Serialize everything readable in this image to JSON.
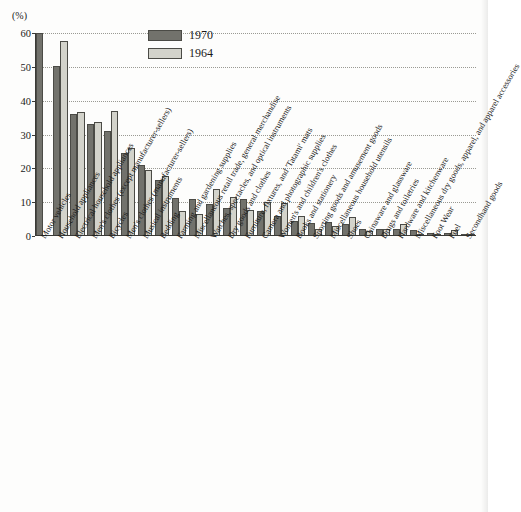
{
  "chart_data": {
    "type": "bar",
    "title": "",
    "subtitle": "",
    "xlabel": "",
    "ylabel": "(%)",
    "ylim": [
      0,
      60
    ],
    "yticks": [
      0,
      10,
      20,
      30,
      40,
      50,
      60
    ],
    "ytick_labels": [
      "0",
      "10",
      "20",
      "30",
      "40",
      "50",
      "60"
    ],
    "grid": true,
    "legend_position": "top-center",
    "categories": [
      "Motor vehicles",
      "Household appliances",
      "Electrical household appliances",
      "Men's clothes (except manufacturer-sellers)",
      "Bicycles",
      "Men's clothes (manufacturer-sellers)",
      "Musical instruments",
      "Bedding",
      "Farming and gardening supplies",
      "Miscellaneous retail trade, general merchandise",
      "Watches, spectacles, and optical instruments",
      "Dry goods and clothes",
      "Furniture, fixtures, and 'Tatami' mats",
      "Camera and photographic supplies",
      "Women's and children's clothes",
      "Books and stationery",
      "Sporting goods and amusement goods",
      "Miscellaneous household utensils",
      "Shoes",
      "Chinaware and glassware",
      "Drugs and toiletries",
      "Hardware and kitchenware",
      "Miscellaneous dry goods, apparel, and apparel accessories",
      "Foot Wear",
      "Fuel",
      "Secondhand goods"
    ],
    "series": [
      {
        "name": "1970",
        "color": "#72726c",
        "values": [
          60.0,
          50.3,
          36.0,
          33.0,
          31.0,
          24.5,
          21.0,
          16.5,
          11.2,
          11.0,
          9.5,
          8.2,
          11.0,
          7.3,
          6.0,
          4.5,
          3.8,
          4.2,
          3.6,
          2.1,
          2.0,
          2.0,
          1.7,
          0.8,
          1.0,
          0.7
        ],
        "labels": [
          "60.0",
          "50.3",
          "36.0",
          "33.0",
          "31.0",
          "24.5",
          "21.0",
          "16.5",
          "11.2",
          "11.0",
          "9.5",
          "8.2",
          "11.0",
          "7.3",
          "6.0",
          "4.5",
          "3.8",
          "4.2",
          "3.6",
          "2.1",
          "2.0",
          "2.0",
          "1.7",
          "0.8",
          "1.0",
          "0.7"
        ]
      },
      {
        "name": "1964",
        "color": "#d3d3cb",
        "values": [
          0.0,
          57.5,
          36.6,
          33.6,
          37.0,
          26.0,
          19.5,
          17.6,
          7.5,
          6.5,
          13.8,
          11.5,
          7.6,
          10.0,
          9.8,
          5.8,
          2.1,
          3.0,
          5.5,
          1.5,
          2.0,
          3.6,
          0.7,
          0.5,
          1.9,
          0.5
        ],
        "labels": [
          "",
          "57.5",
          "36.6",
          "33.6",
          "37.0",
          "26.0",
          "19.5",
          "17.6",
          "7.5",
          "6.5",
          "13.8",
          "11.5",
          "7.6",
          "10.0",
          "9.8",
          "5.8",
          "2.1",
          "3.0",
          "5.5",
          "1.5",
          "2.0",
          "3.6",
          "0.7",
          "0.5",
          "1.9",
          "0.5"
        ]
      }
    ]
  },
  "legend": {
    "items": [
      {
        "label": "1970",
        "key": "s1970"
      },
      {
        "label": "1964",
        "key": "s1964"
      }
    ]
  },
  "axis": {
    "unit": "(%)"
  }
}
